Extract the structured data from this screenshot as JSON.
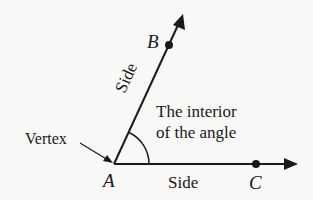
{
  "diagram": {
    "points": {
      "vertex": {
        "label": "A"
      },
      "point_b": {
        "label": "B"
      },
      "point_c": {
        "label": "C"
      }
    },
    "labels": {
      "vertex": "Vertex",
      "side_ab": "Side",
      "side_ac": "Side",
      "interior_line1": "The interior",
      "interior_line2": "of the angle"
    },
    "colors": {
      "ink": "#1a1a1a",
      "background": "#f8f8f6"
    }
  }
}
